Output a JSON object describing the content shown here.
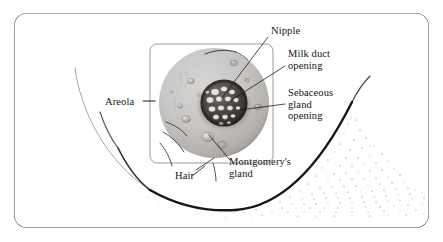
{
  "figure": {
    "kind": "anatomical-illustration",
    "frame": {
      "style": "rounded-rectangle-border",
      "color": "#55555a"
    },
    "inset_box": {
      "style": "rounded-rectangle-border",
      "color": "#9a9a9e"
    },
    "colors": {
      "areola_fill": "#c6c4c2",
      "areola_shadow": "#9d9a98",
      "nipple_dark": "#3a3633",
      "nipple_opening_light": "#e8e6e3",
      "contour_line": "#171717",
      "stipple": "#5a5a5a",
      "label_text": "#141414",
      "leader_line": "#1d1d1d"
    }
  },
  "labels": [
    {
      "id": "nipple",
      "text": "Nipple",
      "x": 271,
      "y": 31,
      "align": "left"
    },
    {
      "id": "milk-duct",
      "text": "Milk duct\nopening",
      "x": 288,
      "y": 54,
      "align": "left"
    },
    {
      "id": "sebaceous-gland",
      "text": "Sebaceous\ngland\nopening",
      "x": 288,
      "y": 93,
      "align": "left"
    },
    {
      "id": "areola",
      "text": "Areola",
      "x": 105,
      "y": 95,
      "align": "left"
    },
    {
      "id": "montgomerys-gland",
      "text": "Montgomery's\ngland",
      "x": 229,
      "y": 157,
      "align": "left"
    },
    {
      "id": "hair",
      "text": "Hair",
      "x": 175,
      "y": 171,
      "align": "left"
    }
  ]
}
